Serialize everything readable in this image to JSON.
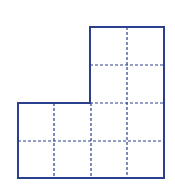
{
  "diagram": {
    "colors": {
      "outline": "#2b3f8f",
      "grid": "#2b3f8f",
      "background": "#ffffff"
    },
    "unit_squares": 12,
    "shape_cells": [
      [
        2,
        0
      ],
      [
        3,
        0
      ],
      [
        2,
        1
      ],
      [
        3,
        1
      ],
      [
        0,
        2
      ],
      [
        1,
        2
      ],
      [
        2,
        2
      ],
      [
        3,
        2
      ],
      [
        0,
        3
      ],
      [
        1,
        3
      ],
      [
        2,
        3
      ],
      [
        3,
        3
      ]
    ],
    "outline_points": "90,27 164,27 164,178 18,178 18,103 90,103",
    "dashed_lines": [
      {
        "x1": 127,
        "y1": 27,
        "x2": 127,
        "y2": 178
      },
      {
        "x1": 90,
        "y1": 65,
        "x2": 164,
        "y2": 65
      },
      {
        "x1": 90,
        "y1": 103,
        "x2": 164,
        "y2": 103
      },
      {
        "x1": 54,
        "y1": 103,
        "x2": 54,
        "y2": 178
      },
      {
        "x1": 91,
        "y1": 103,
        "x2": 91,
        "y2": 178
      },
      {
        "x1": 18,
        "y1": 141,
        "x2": 164,
        "y2": 141
      }
    ]
  }
}
